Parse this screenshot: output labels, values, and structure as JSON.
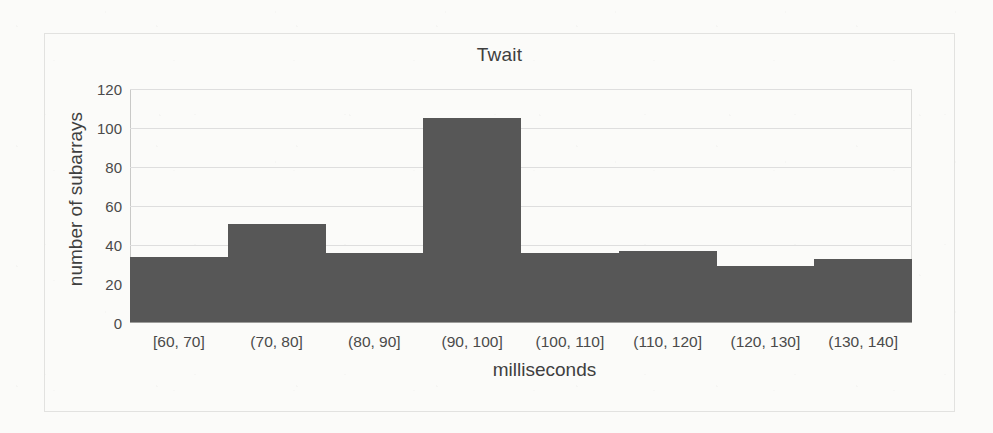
{
  "chart_data": {
    "type": "bar",
    "title": "Twait",
    "xlabel": "milliseconds",
    "ylabel": "number of subarrays",
    "categories": [
      "[60, 70]",
      "(70, 80]",
      "(80, 90]",
      "(90, 100]",
      "(100, 110]",
      "(110, 120]",
      "(120, 130]",
      "(130, 140]"
    ],
    "values": [
      34,
      51,
      36,
      105,
      36,
      37,
      29,
      33
    ],
    "ylim": [
      0,
      120
    ],
    "yticks": [
      0,
      20,
      40,
      60,
      80,
      100,
      120
    ],
    "ytick_labels": [
      "0",
      "20",
      "40",
      "60",
      "80",
      "100",
      "120"
    ],
    "grid": true,
    "legend": "none",
    "bar_color": "#575757",
    "gridline_color": "#dedede",
    "axis_color": "#9d9d9b",
    "background": "#fbfbf9",
    "frame_color": "#e2e2e0"
  }
}
